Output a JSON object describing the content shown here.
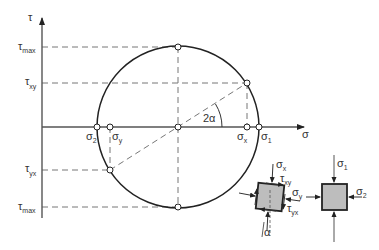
{
  "diagram": {
    "axes": {
      "vertical_label": "τ",
      "horizontal_label": "σ"
    },
    "tau_labels": [
      {
        "base": "τ",
        "sub": "max",
        "name": "tau-max-top"
      },
      {
        "base": "τ",
        "sub": "xy",
        "name": "tau-xy"
      },
      {
        "base": "τ",
        "sub": "yx",
        "name": "tau-yx"
      },
      {
        "base": "τ",
        "sub": "max",
        "name": "tau-max-bottom"
      }
    ],
    "sigma_labels": [
      {
        "base": "σ",
        "sub": "2",
        "name": "sigma-2"
      },
      {
        "base": "σ",
        "sub": "y",
        "name": "sigma-y"
      },
      {
        "base": "σ",
        "sub": "x",
        "name": "sigma-x"
      },
      {
        "base": "σ",
        "sub": "1",
        "name": "sigma-1"
      }
    ],
    "angle_label": "2α",
    "element_rotated": {
      "sigma_x": {
        "base": "σ",
        "sub": "x"
      },
      "tau_xy": {
        "base": "τ",
        "sub": "xy"
      },
      "sigma_y": {
        "base": "σ",
        "sub": "y"
      },
      "tau_yx": {
        "base": "τ",
        "sub": "yx"
      },
      "alpha": "α"
    },
    "element_principal": {
      "sigma_1": {
        "base": "σ",
        "sub": "1"
      },
      "sigma_2": {
        "base": "σ",
        "sub": "2"
      }
    },
    "colors": {
      "line": "#333333",
      "dash": "#777777",
      "element_fill": "#bdbdbd",
      "axis": "#555555"
    }
  }
}
